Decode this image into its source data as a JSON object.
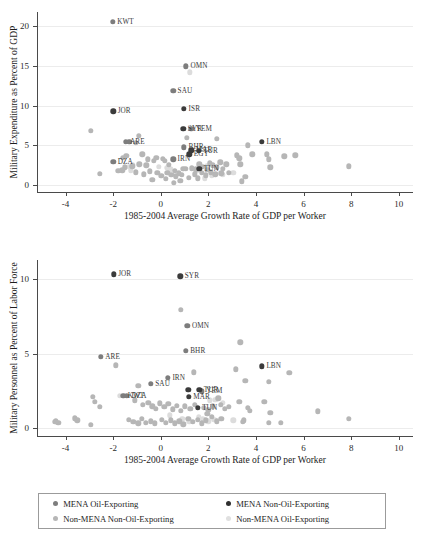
{
  "chart_data": [
    {
      "type": "scatter",
      "id": "military-expenditure",
      "title": "",
      "xlabel": "1985-2004 Average Growth Rate of GDP per Worker",
      "ylabel": "Military Expenditure as Percent of GDP",
      "xlim": [
        -5.2,
        10.6
      ],
      "ylim": [
        -0.9,
        21.8
      ],
      "xticks": [
        -4,
        -2,
        0,
        2,
        4,
        6,
        8,
        10
      ],
      "yticks": [
        0,
        5,
        10,
        15,
        20
      ],
      "grid": true,
      "legend_position": "below-figure",
      "series": [
        {
          "name": "MENA Oil-Exporting",
          "color": "#7d7d7d",
          "points": [
            {
              "x": -2.02,
              "y": 20.6,
              "label": "KWT"
            },
            {
              "x": 1.06,
              "y": 14.95,
              "label": "OMN"
            },
            {
              "x": 0.52,
              "y": 11.85,
              "label": "SAU"
            },
            {
              "x": 1.28,
              "y": 7.1,
              "label": "YEM"
            },
            {
              "x": -1.48,
              "y": 5.45,
              "label": "ARE"
            },
            {
              "x": -1.32,
              "y": 5.42,
              "label": ""
            },
            {
              "x": -2.0,
              "y": 2.9,
              "label": "DZA"
            },
            {
              "x": 0.52,
              "y": 3.2,
              "label": "IRN"
            },
            {
              "x": 0.98,
              "y": 4.75,
              "label": "BHR"
            }
          ]
        },
        {
          "name": "MENA Non-Oil-Exporting",
          "color": "#3b3b3b",
          "points": [
            {
              "x": -2.0,
              "y": 9.3,
              "label": "JOR"
            },
            {
              "x": 0.98,
              "y": 9.6,
              "label": "ISR"
            },
            {
              "x": 0.95,
              "y": 7.05,
              "label": "SYR"
            },
            {
              "x": 4.25,
              "y": 5.45,
              "label": "LBN"
            },
            {
              "x": 1.6,
              "y": 4.3,
              "label": "TUR"
            },
            {
              "x": 1.28,
              "y": 4.35,
              "label": "MAR"
            },
            {
              "x": 1.2,
              "y": 3.85,
              "label": "EGY"
            },
            {
              "x": 1.62,
              "y": 2.0,
              "label": "TUN"
            }
          ]
        },
        {
          "name": "Non-MENA Non-Oil-Exporting",
          "color": "#b6b6b6",
          "points": [
            {
              "x": -2.95,
              "y": 6.85
            },
            {
              "x": -0.92,
              "y": 6.2
            },
            {
              "x": -1.05,
              "y": 5.3
            },
            {
              "x": 1.1,
              "y": 5.95
            },
            {
              "x": 2.35,
              "y": 5.8
            },
            {
              "x": 3.65,
              "y": 5.0
            },
            {
              "x": -1.45,
              "y": 3.65
            },
            {
              "x": -1.6,
              "y": 3.45
            },
            {
              "x": -0.78,
              "y": 3.85
            },
            {
              "x": -0.55,
              "y": 3.2
            },
            {
              "x": -0.3,
              "y": 3.0
            },
            {
              "x": -0.18,
              "y": 3.4
            },
            {
              "x": 0.08,
              "y": 3.25
            },
            {
              "x": 0.18,
              "y": 3.0
            },
            {
              "x": 0.35,
              "y": 2.55
            },
            {
              "x": -0.6,
              "y": 2.45
            },
            {
              "x": -0.9,
              "y": 2.6
            },
            {
              "x": -1.2,
              "y": 2.35
            },
            {
              "x": -1.5,
              "y": 2.2
            },
            {
              "x": -1.62,
              "y": 1.85
            },
            {
              "x": -1.78,
              "y": 1.8
            },
            {
              "x": -2.55,
              "y": 1.4
            },
            {
              "x": -1.05,
              "y": 1.6
            },
            {
              "x": -0.72,
              "y": 1.35
            },
            {
              "x": -0.45,
              "y": 1.7
            },
            {
              "x": -0.15,
              "y": 1.5
            },
            {
              "x": 0.02,
              "y": 1.15
            },
            {
              "x": 0.28,
              "y": 1.55
            },
            {
              "x": 0.45,
              "y": 1.3
            },
            {
              "x": 0.58,
              "y": 1.75
            },
            {
              "x": 0.62,
              "y": 1.1
            },
            {
              "x": 0.75,
              "y": 1.45
            },
            {
              "x": 0.88,
              "y": 1.25
            },
            {
              "x": -0.35,
              "y": 0.6
            },
            {
              "x": 0.55,
              "y": 0.25
            },
            {
              "x": 0.2,
              "y": 0.75
            },
            {
              "x": 1.05,
              "y": 2.0
            },
            {
              "x": 1.3,
              "y": 2.1
            },
            {
              "x": 1.48,
              "y": 1.95
            },
            {
              "x": 1.62,
              "y": 2.6
            },
            {
              "x": 1.78,
              "y": 2.3
            },
            {
              "x": 1.95,
              "y": 1.9
            },
            {
              "x": 2.05,
              "y": 2.7
            },
            {
              "x": 2.2,
              "y": 2.45
            },
            {
              "x": 2.35,
              "y": 2.2
            },
            {
              "x": 2.5,
              "y": 2.85
            },
            {
              "x": 2.62,
              "y": 2.05
            },
            {
              "x": 2.75,
              "y": 2.6
            },
            {
              "x": 1.42,
              "y": 1.35
            },
            {
              "x": 1.72,
              "y": 1.5
            },
            {
              "x": 1.9,
              "y": 1.2
            },
            {
              "x": 2.1,
              "y": 1.6
            },
            {
              "x": 2.3,
              "y": 1.35
            },
            {
              "x": 2.55,
              "y": 1.45
            },
            {
              "x": 1.18,
              "y": 0.9
            },
            {
              "x": 1.55,
              "y": 0.85
            },
            {
              "x": 2.85,
              "y": 1.5
            },
            {
              "x": 3.2,
              "y": 3.75
            },
            {
              "x": 3.3,
              "y": 3.35
            },
            {
              "x": 3.35,
              "y": 2.6
            },
            {
              "x": 3.55,
              "y": 1.05
            },
            {
              "x": 3.4,
              "y": 0.45
            },
            {
              "x": 3.85,
              "y": 3.85
            },
            {
              "x": 4.45,
              "y": 3.85
            },
            {
              "x": 4.55,
              "y": 3.2
            },
            {
              "x": 4.6,
              "y": 2.2
            },
            {
              "x": 5.2,
              "y": 3.6
            },
            {
              "x": 5.65,
              "y": 3.75
            },
            {
              "x": 7.9,
              "y": 2.35
            },
            {
              "x": 0.95,
              "y": 2.05
            },
            {
              "x": 0.82,
              "y": 0.55
            }
          ]
        },
        {
          "name": "Non-MENA Oil-Exporting",
          "color": "#dcdcdc",
          "points": [
            {
              "x": 1.22,
              "y": 14.2
            },
            {
              "x": -1.35,
              "y": 2.25
            },
            {
              "x": -1.18,
              "y": 2.5
            },
            {
              "x": -1.25,
              "y": 1.85
            },
            {
              "x": -0.08,
              "y": 2.3
            },
            {
              "x": 0.4,
              "y": 1.95
            },
            {
              "x": 1.85,
              "y": 0.85
            },
            {
              "x": 2.15,
              "y": 1.15
            },
            {
              "x": 1.5,
              "y": 1.8
            },
            {
              "x": 2.6,
              "y": 1.25
            },
            {
              "x": 1.95,
              "y": 2.4
            },
            {
              "x": 0.25,
              "y": 2.15
            },
            {
              "x": 3.05,
              "y": 1.55
            }
          ]
        }
      ]
    },
    {
      "type": "scatter",
      "id": "military-personnel",
      "title": "",
      "xlabel": "1985-2004 Average Growth Rate of GDP per Worker",
      "ylabel": "Military Personnel as Percent of Labor Force",
      "xlim": [
        -5.2,
        10.6
      ],
      "ylim": [
        -0.55,
        11.3
      ],
      "xticks": [
        -4,
        -2,
        0,
        2,
        4,
        6,
        8,
        10
      ],
      "yticks": [
        0,
        5,
        10
      ],
      "grid": true,
      "legend_position": "below-figure",
      "series": [
        {
          "name": "MENA Oil-Exporting",
          "color": "#7d7d7d",
          "points": [
            {
              "x": 1.12,
              "y": 6.85,
              "label": "OMN"
            },
            {
              "x": -2.52,
              "y": 4.8,
              "label": "ARE"
            },
            {
              "x": 0.3,
              "y": 3.35,
              "label": "IRN"
            },
            {
              "x": -0.42,
              "y": 2.95,
              "label": "SAU"
            },
            {
              "x": -1.58,
              "y": 2.15,
              "label": "KWT"
            },
            {
              "x": -1.42,
              "y": 2.15,
              "label": "DZA"
            },
            {
              "x": 1.72,
              "y": 2.45,
              "label": "YEM"
            },
            {
              "x": 1.05,
              "y": 5.2,
              "label": "BHR"
            }
          ]
        },
        {
          "name": "MENA Non-Oil-Exporting",
          "color": "#3b3b3b",
          "points": [
            {
              "x": -1.98,
              "y": 10.35,
              "label": "JOR"
            },
            {
              "x": 0.82,
              "y": 10.2,
              "label": "SYR"
            },
            {
              "x": 4.25,
              "y": 4.15,
              "label": "LBN"
            },
            {
              "x": 1.62,
              "y": 2.55,
              "label": "TUR"
            },
            {
              "x": 1.15,
              "y": 2.55,
              "label": ""
            },
            {
              "x": 1.18,
              "y": 2.1,
              "label": "MAR"
            },
            {
              "x": 1.55,
              "y": 1.35,
              "label": "TUN"
            }
          ]
        },
        {
          "name": "Non-MENA Non-Oil-Exporting",
          "color": "#b6b6b6",
          "points": [
            {
              "x": 0.85,
              "y": 7.95
            },
            {
              "x": 3.35,
              "y": 5.75
            },
            {
              "x": -1.88,
              "y": 4.2
            },
            {
              "x": 1.38,
              "y": 3.75
            },
            {
              "x": 3.15,
              "y": 3.95
            },
            {
              "x": 5.4,
              "y": 3.7
            },
            {
              "x": 4.55,
              "y": 3.1
            },
            {
              "x": 3.55,
              "y": 3.15
            },
            {
              "x": -0.95,
              "y": 2.85
            },
            {
              "x": -2.85,
              "y": 2.1
            },
            {
              "x": -2.78,
              "y": 1.75
            },
            {
              "x": -2.55,
              "y": 1.4
            },
            {
              "x": -1.1,
              "y": 1.85
            },
            {
              "x": -0.75,
              "y": 1.55
            },
            {
              "x": -0.52,
              "y": 1.7
            },
            {
              "x": -0.35,
              "y": 1.45
            },
            {
              "x": -0.2,
              "y": 1.3
            },
            {
              "x": -0.05,
              "y": 1.65
            },
            {
              "x": 0.15,
              "y": 1.4
            },
            {
              "x": 0.32,
              "y": 1.6
            },
            {
              "x": 0.5,
              "y": 1.25
            },
            {
              "x": 0.68,
              "y": 1.5
            },
            {
              "x": 0.85,
              "y": 1.15
            },
            {
              "x": 1.02,
              "y": 1.45
            },
            {
              "x": 1.25,
              "y": 1.3
            },
            {
              "x": 1.42,
              "y": 1.55
            },
            {
              "x": 1.82,
              "y": 1.35
            },
            {
              "x": 2.0,
              "y": 1.2
            },
            {
              "x": 2.2,
              "y": 1.45
            },
            {
              "x": 2.42,
              "y": 2.0
            },
            {
              "x": 2.52,
              "y": 1.55
            },
            {
              "x": 2.7,
              "y": 1.3
            },
            {
              "x": 2.85,
              "y": 1.4
            },
            {
              "x": -3.6,
              "y": 0.65
            },
            {
              "x": -3.5,
              "y": 0.5
            },
            {
              "x": -4.45,
              "y": 0.4
            },
            {
              "x": -4.3,
              "y": 0.35
            },
            {
              "x": -2.95,
              "y": 0.2
            },
            {
              "x": -1.35,
              "y": 0.55
            },
            {
              "x": -1.15,
              "y": 0.4
            },
            {
              "x": -0.95,
              "y": 0.3
            },
            {
              "x": -0.8,
              "y": 0.6
            },
            {
              "x": -0.62,
              "y": 0.35
            },
            {
              "x": -0.42,
              "y": 0.45
            },
            {
              "x": -0.25,
              "y": 0.3
            },
            {
              "x": 0.05,
              "y": 0.55
            },
            {
              "x": 0.22,
              "y": 0.35
            },
            {
              "x": 0.42,
              "y": 0.5
            },
            {
              "x": 0.6,
              "y": 0.3
            },
            {
              "x": 0.78,
              "y": 0.45
            },
            {
              "x": 0.95,
              "y": 0.25
            },
            {
              "x": 1.15,
              "y": 0.6
            },
            {
              "x": 1.35,
              "y": 0.4
            },
            {
              "x": 1.55,
              "y": 0.55
            },
            {
              "x": 1.72,
              "y": 0.3
            },
            {
              "x": 1.9,
              "y": 0.5
            },
            {
              "x": 2.15,
              "y": 0.75
            },
            {
              "x": 2.35,
              "y": 0.45
            },
            {
              "x": 2.55,
              "y": 0.6
            },
            {
              "x": 3.3,
              "y": 1.75
            },
            {
              "x": 3.65,
              "y": 1.35
            },
            {
              "x": 3.75,
              "y": 1.15
            },
            {
              "x": 3.5,
              "y": 0.5
            },
            {
              "x": 3.45,
              "y": 0.4
            },
            {
              "x": 4.35,
              "y": 1.75
            },
            {
              "x": 4.6,
              "y": 1.0
            },
            {
              "x": 4.55,
              "y": 0.35
            },
            {
              "x": 5.05,
              "y": 0.35
            },
            {
              "x": 6.6,
              "y": 1.1
            },
            {
              "x": 7.9,
              "y": 0.6
            },
            {
              "x": -4.4,
              "y": 0.45
            },
            {
              "x": 1.95,
              "y": 0.95
            }
          ]
        },
        {
          "name": "Non-MENA Oil-Exporting",
          "color": "#dcdcdc",
          "points": [
            {
              "x": -1.72,
              "y": 2.15
            },
            {
              "x": 2.05,
              "y": 1.85
            },
            {
              "x": 2.3,
              "y": 1.9
            },
            {
              "x": 1.78,
              "y": 0.6
            },
            {
              "x": 2.0,
              "y": 0.45
            },
            {
              "x": 2.25,
              "y": 0.55
            },
            {
              "x": 0.9,
              "y": 0.6
            },
            {
              "x": 1.2,
              "y": 0.45
            },
            {
              "x": 2.62,
              "y": 1.7
            },
            {
              "x": 1.6,
              "y": 0.75
            },
            {
              "x": 0.38,
              "y": 0.85
            },
            {
              "x": 3.05,
              "y": 0.5
            }
          ]
        }
      ]
    }
  ],
  "legend": {
    "items": [
      {
        "label": "MENA Oil-Exporting",
        "series_class": "s-mena-oil"
      },
      {
        "label": "MENA Non-Oil-Exporting",
        "series_class": "s-mena-nonoil"
      },
      {
        "label": "Non-MENA Non-Oil-Exporting",
        "series_class": "s-non-mena-nonoil"
      },
      {
        "label": "Non-MENA Oil-Exporting",
        "series_class": "s-non-mena-oil"
      }
    ]
  },
  "colors": {
    "mena_oil": "#7d7d7d",
    "mena_nonoil": "#3b3b3b",
    "non_mena_nonoil": "#b6b6b6",
    "non_mena_oil": "#dcdcdc",
    "axis": "#4a4a4a",
    "grid": "#ececec",
    "text": "#1d1d1d"
  }
}
